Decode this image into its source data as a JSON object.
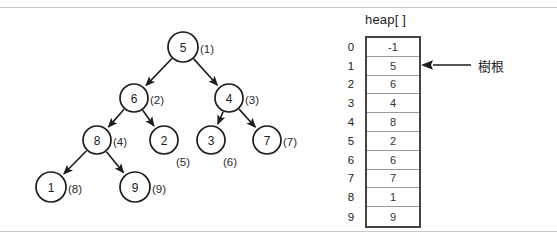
{
  "figure": {
    "tree": {
      "nodes": [
        {
          "id": "n1",
          "value": "5",
          "label": "(1)",
          "cx": 183,
          "cy": 47,
          "r": 15,
          "label_dx": 17
        },
        {
          "id": "n2",
          "value": "6",
          "label": "(2)",
          "cx": 134,
          "cy": 98,
          "r": 14,
          "label_dx": 16
        },
        {
          "id": "n3",
          "value": "4",
          "label": "(3)",
          "cx": 229,
          "cy": 98,
          "r": 14,
          "label_dx": 16
        },
        {
          "id": "n4",
          "value": "8",
          "label": "(4)",
          "cx": 97,
          "cy": 140,
          "r": 14,
          "label_dx": 16
        },
        {
          "id": "n5",
          "value": "2",
          "label": "(5)",
          "cx": 164,
          "cy": 140,
          "r": 14,
          "label_dx": 12,
          "label_dy": 22
        },
        {
          "id": "n6",
          "value": "3",
          "label": "(6)",
          "cx": 211,
          "cy": 140,
          "r": 14,
          "label_dx": 12,
          "label_dy": 22
        },
        {
          "id": "n7",
          "value": "7",
          "label": "(7)",
          "cx": 267,
          "cy": 140,
          "r": 14,
          "label_dx": 16
        },
        {
          "id": "n8",
          "value": "1",
          "label": "(8)",
          "cx": 51,
          "cy": 187,
          "r": 15,
          "label_dx": 17
        },
        {
          "id": "n9",
          "value": "9",
          "label": "(9)",
          "cx": 135,
          "cy": 187,
          "r": 15,
          "label_dx": 17
        }
      ],
      "edges": [
        {
          "from": "n1",
          "to": "n2"
        },
        {
          "from": "n1",
          "to": "n3"
        },
        {
          "from": "n2",
          "to": "n4"
        },
        {
          "from": "n2",
          "to": "n5"
        },
        {
          "from": "n3",
          "to": "n6"
        },
        {
          "from": "n3",
          "to": "n7"
        },
        {
          "from": "n4",
          "to": "n8"
        },
        {
          "from": "n4",
          "to": "n9"
        }
      ]
    },
    "array": {
      "header": "heap[ ]",
      "indices": [
        "0",
        "1",
        "2",
        "3",
        "4",
        "5",
        "6",
        "7",
        "8",
        "9"
      ],
      "values": [
        "-1",
        "5",
        "6",
        "4",
        "8",
        "2",
        "6",
        "7",
        "1",
        "9"
      ]
    },
    "annotation": {
      "root_label": "樹根",
      "points_to_index": "1"
    },
    "colors": {
      "stroke": "#1c1c1c",
      "rule": "#c9c9c9",
      "table_border": "#444444",
      "cell_divider": "#9a9a9a",
      "background": "#ffffff"
    }
  }
}
